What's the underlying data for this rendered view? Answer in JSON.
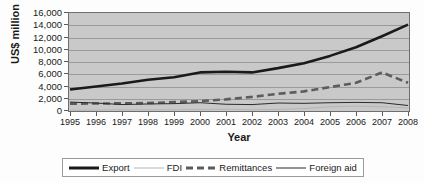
{
  "chart_data": {
    "type": "line",
    "title": "",
    "xlabel": "Year",
    "ylabel": "US$ million",
    "categories": [
      "1995",
      "1996",
      "1997",
      "1998",
      "1999",
      "2000",
      "2001",
      "2002",
      "2003",
      "2004",
      "2005",
      "2006",
      "2007",
      "2008"
    ],
    "x": [
      1995,
      1996,
      1997,
      1998,
      1999,
      2000,
      2001,
      2002,
      2003,
      2004,
      2005,
      2006,
      2007,
      2008
    ],
    "ylim": [
      0,
      16000
    ],
    "ytick_labels": [
      "16,000",
      "14,000",
      "12,000",
      "10,000",
      "8,000",
      "6,000",
      "4,000",
      "2,000",
      "0"
    ],
    "ytick_values": [
      16000,
      14000,
      12000,
      10000,
      8000,
      6000,
      4000,
      2000,
      0
    ],
    "grid": "horizontal",
    "legend_position": "bottom",
    "series": [
      {
        "name": "Export",
        "style": "solid-thick",
        "color": "#1a1a1a",
        "values": [
          3500,
          4000,
          4500,
          5100,
          5500,
          6300,
          6400,
          6300,
          7000,
          7800,
          9000,
          10400,
          12200,
          14100
        ]
      },
      {
        "name": "FDI",
        "style": "solid-thin-light",
        "color": "#b5b5b5",
        "values": [
          120,
          150,
          200,
          180,
          200,
          250,
          300,
          200,
          250,
          400,
          700,
          800,
          700,
          500
        ]
      },
      {
        "name": "Remittances",
        "style": "dashed-thick",
        "color": "#5c5c5c",
        "values": [
          1200,
          1220,
          1250,
          1300,
          1450,
          1600,
          1900,
          2300,
          2800,
          3200,
          3900,
          4600,
          6300,
          4600
        ]
      },
      {
        "name": "Foreign aid",
        "style": "solid-thin-dark",
        "color": "#2b2b2b",
        "values": [
          1450,
          1300,
          1050,
          1150,
          1200,
          1350,
          1100,
          1050,
          1300,
          1250,
          1350,
          1400,
          1350,
          900
        ]
      }
    ]
  },
  "legend": {
    "items": [
      {
        "label": "Export"
      },
      {
        "label": "FDI"
      },
      {
        "label": "Remittances"
      },
      {
        "label": "Foreign aid"
      }
    ]
  },
  "axes": {
    "y_title": "US$ million",
    "x_title": "Year"
  },
  "colors": {
    "plot_background": "#c9c9c9",
    "gridline": "#9a9a9a",
    "axis": "#6e6e6e",
    "text": "#1a1a1a",
    "export": "#1a1a1a",
    "fdi": "#b5b5b5",
    "remittances": "#5c5c5c",
    "foreign_aid": "#2b2b2b"
  }
}
